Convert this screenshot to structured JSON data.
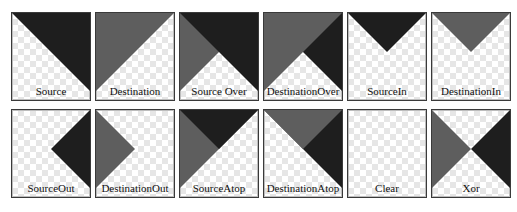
{
  "colors": {
    "source": "#1e1e1e",
    "destination": "#5e5e5e",
    "checker": "#e6e6e6",
    "border": "#3a3a3a"
  },
  "modes": [
    {
      "label": "Source",
      "shapes": [
        "src"
      ]
    },
    {
      "label": "Destination",
      "shapes": [
        "dst"
      ]
    },
    {
      "label": "Source Over",
      "shapes": [
        "dst",
        "src"
      ]
    },
    {
      "label": "DestinationOver",
      "shapes": [
        "src",
        "dst"
      ]
    },
    {
      "label": "SourceIn",
      "shapes": [
        "src_in"
      ]
    },
    {
      "label": "DestinationIn",
      "shapes": [
        "dst_in"
      ]
    },
    {
      "label": "SourceOut",
      "shapes": [
        "src_out"
      ]
    },
    {
      "label": "DestinationOut",
      "shapes": [
        "dst_out"
      ]
    },
    {
      "label": "SourceAtop",
      "shapes": [
        "dst_in",
        "src_in_dst"
      ]
    },
    {
      "label": "DestinationAtop",
      "shapes": [
        "src_in_dark",
        "dst_in"
      ]
    },
    {
      "label": "Clear",
      "shapes": []
    },
    {
      "label": "Xor",
      "shapes": [
        "dst_out",
        "src_out"
      ]
    }
  ]
}
